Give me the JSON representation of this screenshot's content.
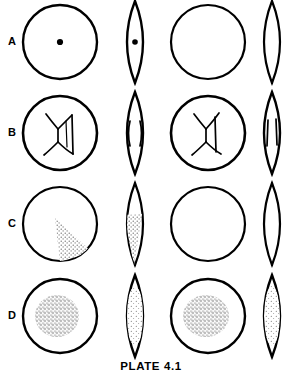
{
  "plate": {
    "caption": "PLATE 4.1",
    "ink_color": "#000000",
    "background_color": "#ffffff",
    "stipple_color": "#555555"
  },
  "rows": [
    {
      "label": "A",
      "label_y": 33,
      "cells": [
        {
          "name": "circle-with-central-dot",
          "shape": "circle",
          "fill": "center-dot"
        },
        {
          "name": "lens-with-central-dot",
          "shape": "lens",
          "fill": "center-dot"
        },
        {
          "name": "plain-circle",
          "shape": "circle",
          "fill": "none"
        },
        {
          "name": "plain-lens",
          "shape": "lens",
          "fill": "none"
        }
      ]
    },
    {
      "label": "B",
      "label_y": 124,
      "cells": [
        {
          "name": "circle-with-branching-lines",
          "shape": "circle",
          "fill": "branching-lines"
        },
        {
          "name": "lens-with-paired-lines",
          "shape": "lens",
          "fill": "paired-curved-lines"
        },
        {
          "name": "circle-with-branching-lines",
          "shape": "circle",
          "fill": "branching-lines"
        },
        {
          "name": "lens-with-paired-lines",
          "shape": "lens",
          "fill": "paired-straight-lines"
        }
      ]
    },
    {
      "label": "C",
      "label_y": 215,
      "cells": [
        {
          "name": "circle-with-stippled-wedge",
          "shape": "circle",
          "fill": "stipple-wedge"
        },
        {
          "name": "lens-with-stippled-wedge",
          "shape": "lens",
          "fill": "stipple-wedge"
        },
        {
          "name": "plain-circle",
          "shape": "circle",
          "fill": "none"
        },
        {
          "name": "plain-lens",
          "shape": "lens",
          "fill": "none"
        }
      ]
    },
    {
      "label": "D",
      "label_y": 307,
      "cells": [
        {
          "name": "circle-with-stippled-patch",
          "shape": "circle",
          "fill": "stipple-patch-dense"
        },
        {
          "name": "lens-with-stippled-patch",
          "shape": "lens",
          "fill": "stipple-patch-elongate"
        },
        {
          "name": "circle-with-stippled-patch",
          "shape": "circle",
          "fill": "stipple-patch-dense"
        },
        {
          "name": "lens-with-stippled-patch",
          "shape": "lens",
          "fill": "stipple-patch-sparse"
        }
      ]
    }
  ],
  "geometry": {
    "column_centers": [
      60,
      135,
      208,
      272
    ],
    "row_centers": [
      42,
      133,
      224,
      316
    ],
    "circle_radius": 37,
    "lens_half_width": 16,
    "lens_half_height": 41
  }
}
